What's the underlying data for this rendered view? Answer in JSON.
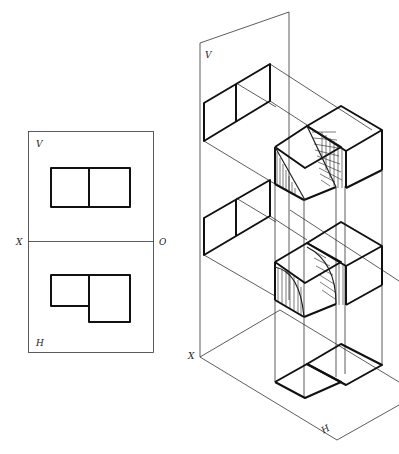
{
  "figure": {
    "orthographic_panel": {
      "labels": {
        "v": "V",
        "x": "X",
        "o": "O",
        "h": "H"
      },
      "front_view": "two adjacent equal rectangles",
      "top_view": "small rectangle left, taller rectangle right (L-shaped footprint)"
    },
    "isometric_panel": {
      "labels": {
        "v": "V",
        "x": "X",
        "h": "H"
      },
      "description": "Pictorial projection of an L-shaped block with a quarter-cylindrical cut, projected onto V plane and H plane, with hatched curved surfaces"
    },
    "colors": {
      "line": "#111111",
      "background": "#ffffff"
    }
  }
}
